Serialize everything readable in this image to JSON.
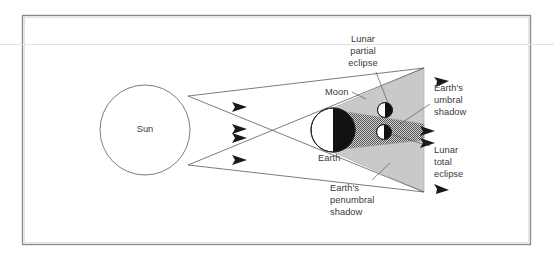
{
  "figure": {
    "border_color": "#8a8a8a",
    "background_color": "#ffffff"
  },
  "bodies": {
    "sun": {
      "label": "Sun",
      "fill": "#ffffff",
      "stroke": "#6e6e6e",
      "cx": 145,
      "cy": 130,
      "r": 45
    },
    "earth": {
      "label": "Earth",
      "lit_fill": "#ffffff",
      "dark_fill": "#111111",
      "stroke": "#222222",
      "cx": 333,
      "cy": 130,
      "r": 22
    },
    "moon_partial": {
      "label": "Moon",
      "lit_fill": "#ffffff",
      "dark_fill": "#111111",
      "stroke": "#222222",
      "cx": 385,
      "cy": 110,
      "r": 7.5
    },
    "moon_total": {
      "label": "Moon",
      "lit_fill": "#ffffff",
      "dark_fill": "#111111",
      "stroke": "#222222",
      "cx": 384,
      "cy": 132,
      "r": 7.5
    }
  },
  "shadows": {
    "penumbra": {
      "name": "Earth's penumbral shadow",
      "fill": "#c9c9c9",
      "stroke": "#b0b0b0"
    },
    "umbra": {
      "name": "Earth's umbral shadow",
      "fill": "#9a9a9a",
      "pattern": "checkerboard"
    }
  },
  "labels": {
    "lunar_partial_eclipse": {
      "lines": [
        "Lunar",
        "partial",
        "eclipse"
      ],
      "text": "Lunar\npartial\neclipse",
      "x": 348,
      "y": 36
    },
    "moon": {
      "text": "Moon",
      "x": 325,
      "y": 88
    },
    "earth": {
      "text": "Earth",
      "x": 318,
      "y": 154
    },
    "earths_umbral_shadow": {
      "lines": [
        "Earth's",
        "umbral",
        "shadow"
      ],
      "text": "Earth's\numbral\nshadow",
      "x": 434,
      "y": 84
    },
    "lunar_total_eclipse": {
      "lines": [
        "Lunar",
        "total",
        "eclipse"
      ],
      "text": "Lunar\ntotal\neclipse",
      "x": 434,
      "y": 146
    },
    "earths_penumbral_shadow": {
      "lines": [
        "Earth's",
        "penumbral",
        "shadow"
      ],
      "text": "Earth's\npenumbral\nshadow",
      "x": 330,
      "y": 184
    }
  },
  "rays": {
    "count": 4,
    "stroke": "#5a5a5a",
    "arrow_fill": "#1a1a1a",
    "description": "Light rays from the Sun's limbs crossing to define umbra and penumbra"
  },
  "arrows": {
    "right_edge_count": 4,
    "fill": "#1a1a1a"
  }
}
